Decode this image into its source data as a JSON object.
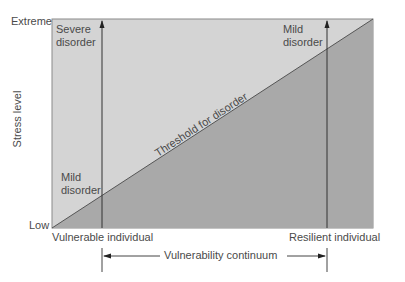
{
  "diagram": {
    "y_axis": {
      "title": "Stress level",
      "top_label": "Extreme",
      "bottom_label": "Low"
    },
    "x_axis": {
      "left_label": "Vulnerable individual",
      "right_label": "Resilient individual",
      "continuum_label": "Vulnerability continuum"
    },
    "regions": {
      "vulnerable_severe": "Severe\ndisorder",
      "vulnerable_mild": "Mild\ndisorder",
      "resilient_mild": "Mild\ndisorder"
    },
    "threshold_label": "Threshold for disorder",
    "colors": {
      "above_threshold": "#d4d4d4",
      "below_threshold": "#a9a9a9",
      "line": "#333333",
      "text": "#4a4a4a"
    }
  }
}
